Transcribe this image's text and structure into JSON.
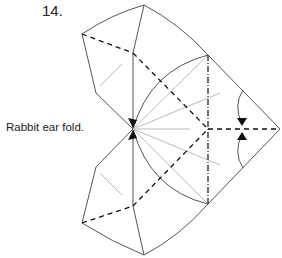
{
  "step": {
    "number": "14.",
    "instruction": "Rabbit ear fold."
  },
  "colors": {
    "line": "#555555",
    "crease": "#bbbbbb",
    "fold": "#111111"
  }
}
